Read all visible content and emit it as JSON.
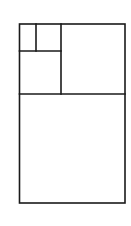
{
  "diagram": {
    "type": "golden-rectangle-subdivision",
    "stroke_color": "#1a1a1a",
    "background": "#ffffff",
    "rectangles": [
      {
        "name": "outer-rectangle",
        "x": 19.5,
        "y": 24,
        "w": 105.5,
        "h": 179
      },
      {
        "name": "bottom-square",
        "x": 19.5,
        "y": 94,
        "w": 105.5,
        "h": 109
      },
      {
        "name": "top-right-square",
        "x": 61,
        "y": 24,
        "w": 64,
        "h": 70
      },
      {
        "name": "mid-left-square",
        "x": 19.5,
        "y": 51,
        "w": 41.5,
        "h": 43
      },
      {
        "name": "top-right-small-square",
        "x": 36,
        "y": 24,
        "w": 25,
        "h": 27
      },
      {
        "name": "top-left-small-rectangle",
        "x": 19.5,
        "y": 24,
        "w": 16.5,
        "h": 27
      }
    ]
  }
}
